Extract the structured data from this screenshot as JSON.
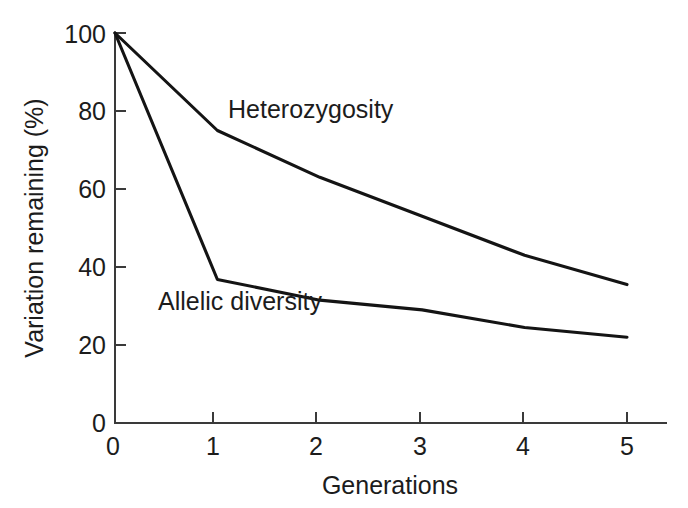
{
  "chart_data": {
    "type": "line",
    "title": "",
    "xlabel": "Generations",
    "ylabel": "Variation remaining (%)",
    "x": [
      0,
      1,
      2,
      3,
      4,
      5
    ],
    "xlim": [
      0,
      5
    ],
    "ylim": [
      0,
      100
    ],
    "xticks": [
      "0",
      "1",
      "2",
      "3",
      "4",
      "5"
    ],
    "yticks": [
      "0",
      "20",
      "40",
      "60",
      "80",
      "100"
    ],
    "grid": false,
    "legend_position": "inline-annotations",
    "series": [
      {
        "name": "Heterozygosity",
        "values": [
          100,
          75,
          63,
          53,
          43,
          35.5
        ],
        "color": "#141414",
        "label_x": 2.0,
        "label_y": 84
      },
      {
        "name": "Allelic diversity",
        "values": [
          100,
          36.8,
          31.5,
          29,
          24.5,
          22
        ],
        "color": "#141414",
        "label_x": 0.55,
        "label_y": 25.5
      }
    ],
    "annotations": [
      {
        "text": "Heterozygosity",
        "x": 2.0,
        "y": 84
      },
      {
        "text": "Allelic diversity",
        "x": 0.55,
        "y": 25.5
      }
    ]
  },
  "axes": {
    "x_tick_labels": [
      "0",
      "1",
      "2",
      "3",
      "4",
      "5"
    ],
    "y_tick_labels": [
      "0",
      "20",
      "40",
      "60",
      "80",
      "100"
    ],
    "x_axis_title": "Generations",
    "y_axis_title": "Variation remaining (%)"
  }
}
